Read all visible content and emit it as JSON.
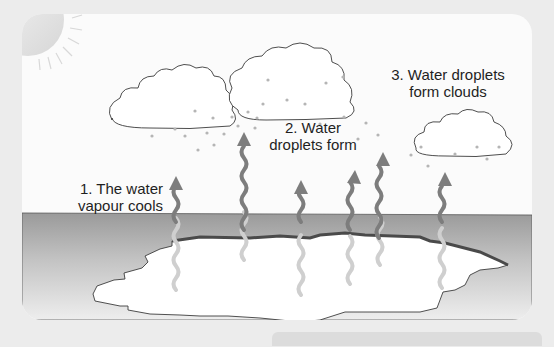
{
  "diagram": {
    "labels": [
      {
        "id": "step-1",
        "lines": [
          "1. The water",
          "vapour cools"
        ]
      },
      {
        "id": "step-2",
        "lines": [
          "2. Water",
          "droplets form"
        ]
      },
      {
        "id": "step-3",
        "lines": [
          "3. Water droplets",
          "form clouds"
        ]
      }
    ],
    "elements": {
      "sun": "sun-icon",
      "clouds": 3,
      "vapour_arrows": 6,
      "water_body": "lake"
    },
    "colors": {
      "background": "#ececec",
      "panel": "#fbfbfb",
      "ground_top": "#9a9a9a",
      "ground_bottom": "#e4e4e4",
      "arrow": "#7d7d7d",
      "arrow_faded": "#c9c9c9",
      "outline": "#3c3c3c",
      "droplet": "#b5b5b5"
    }
  }
}
